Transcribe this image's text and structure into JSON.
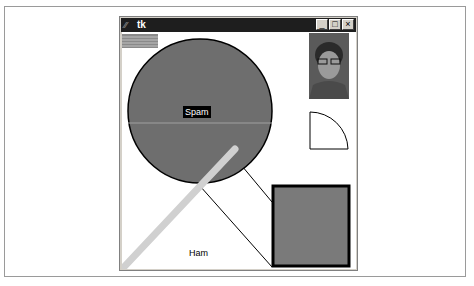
{
  "window": {
    "title": "tk",
    "app_icon": "tk-feather-icon",
    "controls": {
      "minimize": "_",
      "maximize": "□",
      "close": "×"
    }
  },
  "canvas": {
    "background": "#ffffff",
    "circle": {
      "label": "Spam",
      "fill": "#6e6e6e",
      "stroke": "#000000"
    },
    "text_ham": "Ham",
    "square": {
      "fill": "#7a7a7a",
      "stroke": "#000000"
    },
    "stripe_rect": {
      "fill": "#8a8a8a"
    },
    "photo_alt": "portrait photo",
    "arc_shape": "quarter-arc"
  },
  "colors": {
    "title_bar": "#1e1e1e",
    "diagonal_thick_line": "#d0d0d0",
    "thin_line": "#000000",
    "window_chrome": "#d4d0c8"
  }
}
